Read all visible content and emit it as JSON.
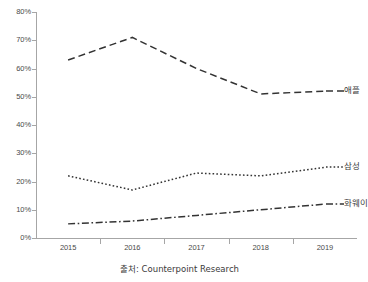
{
  "chart_data": {
    "type": "line",
    "title": "",
    "subtitle": "",
    "xlabel": "",
    "ylabel": "",
    "categories": [
      "2015",
      "2016",
      "2017",
      "2018",
      "2019"
    ],
    "ylim": [
      0,
      80
    ],
    "ytick_labels": [
      "0%",
      "10%",
      "20%",
      "30%",
      "40%",
      "50%",
      "60%",
      "70%",
      "80%"
    ],
    "ytick_values": [
      0,
      10,
      20,
      30,
      40,
      50,
      60,
      70,
      80
    ],
    "yunit": "%",
    "grid": false,
    "legend_position": "inline-right",
    "series": [
      {
        "name": "애플",
        "values": [
          63,
          71,
          60,
          51,
          52
        ],
        "dash": "long-dash",
        "color": "#333333"
      },
      {
        "name": "삼성",
        "values": [
          22,
          17,
          23,
          22,
          25
        ],
        "dash": "dotted",
        "color": "#333333"
      },
      {
        "name": "화웨이",
        "values": [
          5,
          6,
          8,
          10,
          12
        ],
        "dash": "dash-dot",
        "color": "#333333"
      }
    ],
    "annotations": []
  },
  "caption": {
    "text": "출처: Counterpoint Research"
  },
  "axis": {
    "line_color": "#a6a6a6",
    "tick_color": "#a6a6a6",
    "label_color": "#4a4a4a"
  }
}
